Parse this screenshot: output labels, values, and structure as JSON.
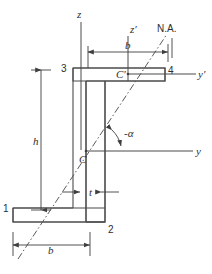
{
  "figure": {
    "shape_name": "z-section-profile"
  },
  "axes": [
    {
      "id": "z",
      "label": "z",
      "orientation": "vertical",
      "origin": "C",
      "description": "centroidal vertical axis through C"
    },
    {
      "id": "y",
      "label": "y",
      "orientation": "horizontal",
      "origin": "C",
      "description": "centroidal horizontal axis through C"
    },
    {
      "id": "zp",
      "label": "z′",
      "orientation": "vertical",
      "origin": "C'",
      "description": "vertical axis through C-prime"
    },
    {
      "id": "yp",
      "label": "y′",
      "orientation": "horizontal",
      "origin": "C'",
      "description": "horizontal axis through C-prime"
    }
  ],
  "neutral_axis": {
    "label": "N.A.",
    "style": "dash-dot",
    "description": "inclined neutral axis passing through centroid C"
  },
  "angle": {
    "label": "α",
    "prefix": "-",
    "display": "-α",
    "description": "angle between neutral axis and y axis, measured at C"
  },
  "corner_labels": [
    {
      "id": "1",
      "label": "1",
      "position": "bottom-left"
    },
    {
      "id": "2",
      "label": "2",
      "position": "bottom-right"
    },
    {
      "id": "3",
      "label": "3",
      "position": "top-left"
    },
    {
      "id": "4",
      "label": "4",
      "position": "top-right"
    }
  ],
  "centroids": [
    {
      "id": "C",
      "label": "C",
      "description": "section centroid"
    },
    {
      "id": "Cp",
      "label": "C′",
      "description": "flange centroid C-prime"
    }
  ],
  "dimensions": [
    {
      "id": "h",
      "label": "h",
      "orientation": "vertical",
      "description": "overall section depth, left side"
    },
    {
      "id": "b-top",
      "label": "b",
      "orientation": "horizontal",
      "description": "top flange width"
    },
    {
      "id": "b-bottom",
      "label": "b",
      "orientation": "horizontal",
      "description": "bottom flange width"
    },
    {
      "id": "t",
      "label": "t",
      "orientation": "horizontal",
      "description": "web / wall thickness"
    }
  ],
  "colors": {
    "outline": "#4a4a4a",
    "axis": "#4a4a4a",
    "dimension": "#3f3f3f",
    "neutral_axis": "#5a5a5a",
    "text": "#2e2e2e",
    "background": "#ffffff"
  }
}
